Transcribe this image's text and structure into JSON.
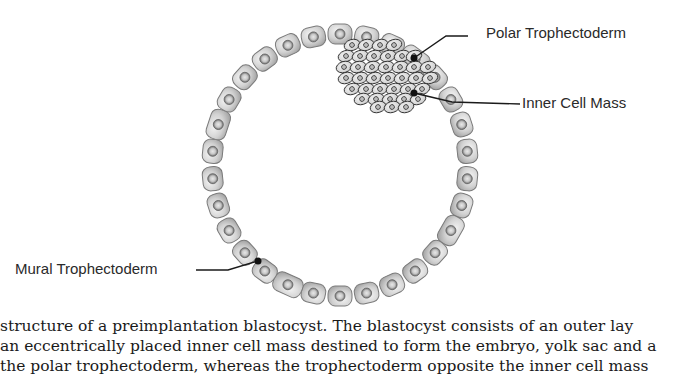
{
  "figure": {
    "labels": {
      "polar": "Polar Trophectoderm",
      "icm": "Inner Cell Mass",
      "mural": "Mural Trophectoderm"
    },
    "ring": {
      "cx": 340,
      "cy": 165,
      "rx": 128,
      "ry": 131,
      "cell_count": 30
    },
    "colors": {
      "cell_fill": "#d4d4d4",
      "cell_stroke": "#7a7a7a",
      "nucleus": "#9a9a9a",
      "leader": "#1a1a1a"
    }
  },
  "caption": {
    "lines": [
      " structure of a preimplantation blastocyst. The blastocyst consists of an outer lay",
      "an eccentrically placed inner cell mass destined to form the embryo, yolk sac and a",
      " the polar trophectoderm, whereas the trophectoderm opposite the inner cell mass"
    ]
  }
}
